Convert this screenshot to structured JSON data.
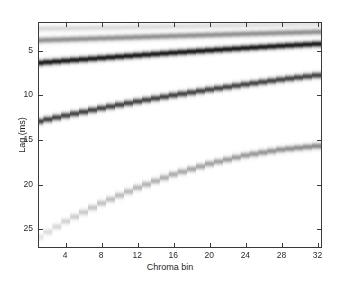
{
  "figure": {
    "background": "#ffffff",
    "axis_color": "#3a3a3a",
    "text_color": "#1e1e1e"
  },
  "axes": {
    "xlabel": "Chroma bin",
    "ylabel": "Lag (ms)",
    "x_ticks": [
      "4",
      "8",
      "12",
      "16",
      "20",
      "24",
      "28",
      "32"
    ],
    "y_ticks": [
      "5",
      "10",
      "15",
      "20",
      "25"
    ]
  },
  "chart_data": {
    "type": "heatmap",
    "title": "",
    "xlabel": "Chroma bin",
    "ylabel": "Lag (ms)",
    "x_tick_values": [
      4,
      8,
      12,
      16,
      20,
      24,
      28,
      32
    ],
    "y_tick_values": [
      5,
      10,
      15,
      20,
      25
    ],
    "xlim": [
      1,
      32.5
    ],
    "ylim": [
      27.2,
      1.9
    ],
    "y_inverted": true,
    "grid": false,
    "legend": null,
    "colormap": "gray_inverted",
    "series": [
      {
        "name": "band-1",
        "darkness": 0.14,
        "x": [
          1,
          4,
          8,
          12,
          16,
          20,
          24,
          28,
          32.5
        ],
        "values": [
          2.55,
          2.5,
          2.43,
          2.36,
          2.29,
          2.22,
          2.15,
          2.09,
          2.02
        ]
      },
      {
        "name": "band-2",
        "darkness": 0.42,
        "x": [
          1,
          4,
          8,
          12,
          16,
          20,
          24,
          28,
          32.5
        ],
        "values": [
          3.85,
          3.76,
          3.63,
          3.5,
          3.37,
          3.25,
          3.13,
          3.02,
          2.9
        ]
      },
      {
        "name": "band-3",
        "darkness": 0.88,
        "x": [
          1,
          4,
          8,
          12,
          16,
          20,
          24,
          28,
          32.5
        ],
        "values": [
          6.4,
          6.16,
          5.85,
          5.55,
          5.26,
          4.99,
          4.73,
          4.49,
          4.24
        ]
      },
      {
        "name": "band-4",
        "darkness": 0.72,
        "x": [
          1,
          4,
          8,
          12,
          16,
          20,
          24,
          28,
          32.5
        ],
        "values": [
          13.0,
          12.35,
          11.52,
          10.76,
          10.06,
          9.42,
          8.83,
          8.29,
          7.75
        ]
      },
      {
        "name": "band-5",
        "darkness": 0.45,
        "x": [
          1,
          4,
          8,
          12,
          16,
          20,
          24,
          28,
          32.5
        ],
        "values": [
          26.1,
          24.3,
          22.25,
          20.5,
          19.0,
          17.8,
          16.85,
          16.2,
          15.75
        ]
      }
    ]
  }
}
